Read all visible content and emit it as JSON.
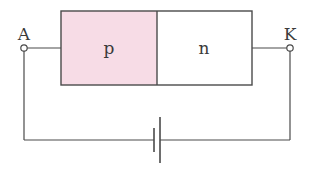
{
  "diagram": {
    "type": "pn-junction-circuit",
    "regions": [
      {
        "label": "p",
        "fill": "#f7dce6"
      },
      {
        "label": "n",
        "fill": "#ffffff"
      }
    ],
    "terminals": {
      "left": {
        "label": "A"
      },
      "right": {
        "label": "K"
      }
    },
    "battery": {
      "symbol": "dc-cell"
    },
    "colors": {
      "line": "#4a4a4a",
      "p_region": "#f7dce6",
      "n_region": "#ffffff"
    }
  }
}
